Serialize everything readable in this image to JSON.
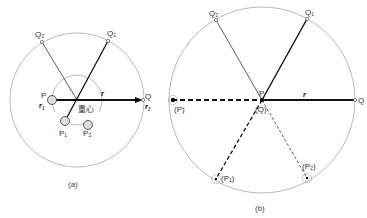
{
  "figure_a": {
    "caption": "(a)",
    "labels": {
      "Q": "Q",
      "Q1": "Q₁",
      "Q2": "Q₂",
      "P": "P",
      "P1": "P₁",
      "P2": "P₂",
      "r": "r",
      "r1": "r₁",
      "r2": "r₂",
      "center_of_mass": "重心"
    }
  },
  "figure_b": {
    "caption": "(b)",
    "labels": {
      "Q": "Q",
      "Q1": "Q₁",
      "Q2": "Q₂",
      "P": "P",
      "P_image": "(P)",
      "Q_image": "(Q)",
      "P1_image": "(P₁)",
      "P2_image": "(P₂)",
      "r": "r"
    }
  },
  "colors": {
    "line": "#111111",
    "circle": "#888888",
    "text": "#333333"
  }
}
